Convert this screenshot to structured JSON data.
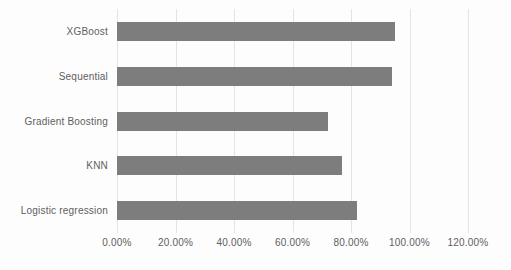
{
  "chart_data": {
    "type": "bar",
    "orientation": "horizontal",
    "title": "",
    "categories": [
      "XGBoost",
      "Sequential",
      "Gradient Boosting",
      "KNN",
      "Logistic regression"
    ],
    "values": [
      95,
      94,
      72,
      77,
      82
    ],
    "unit": "%",
    "xlabel": "",
    "ylabel": "",
    "xlim": [
      0,
      120
    ],
    "x_ticks": [
      0,
      20,
      40,
      60,
      80,
      100,
      120
    ],
    "x_tick_labels": [
      "0.00%",
      "20.00%",
      "40.00%",
      "60.00%",
      "80.00%",
      "100.00%",
      "120.00%"
    ],
    "grid": true,
    "legend": false,
    "colors": {
      "bar": "#7d7d7d",
      "gridline": "#e4e4e4",
      "text": "#606060",
      "background": "#fdfdfd"
    }
  }
}
